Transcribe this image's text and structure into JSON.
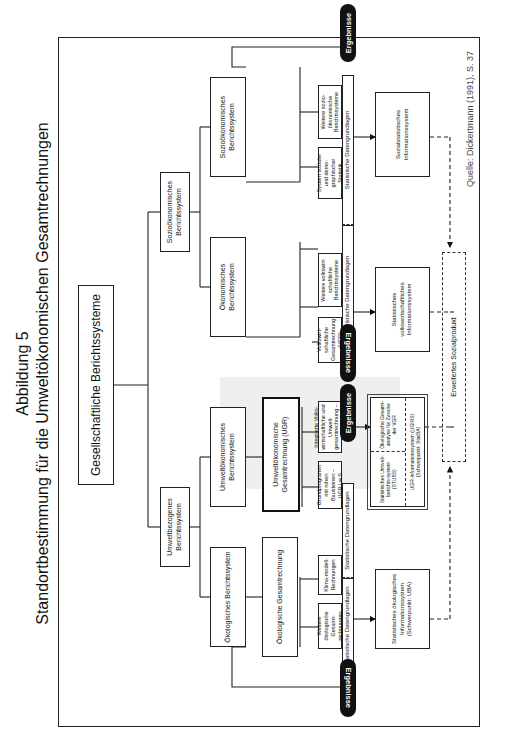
{
  "title": {
    "line1": "Abbildung 5",
    "line2": "Standortbestimmung für die Umweltökonomischen Gesamtrechnungen"
  },
  "source": "Quelle: Dickertmann (1991), S. 37",
  "level1": {
    "label": "Gesellschaftliche Berichtssysteme"
  },
  "level2": [
    {
      "label": "Umweltbezogenes Berichtssystem"
    },
    {
      "label": "Sozioökonomisches Berichtssystem"
    }
  ],
  "level3": [
    {
      "label": "Ökologisches Berichtssystem"
    },
    {
      "label": "Umweltökonomisches Berichtssystem"
    },
    {
      "label": "Ökonomisches Berichtssystem"
    },
    {
      "label": "Sozioökonomisches Berichtssystem"
    }
  ],
  "level4": [
    {
      "label": "Ökologische Gesamtrechnung"
    },
    {
      "label": "Umweltökonomische Gesamtrechnung (UGR)"
    }
  ],
  "sub_boxes": [
    {
      "label": "Weitere ökologische Gesamt-rechnungen"
    },
    {
      "label": "Klima-modell-Rechnungen"
    },
    {
      "label": "Grundprogramm mit rohen Bausteinen – UGR i.w.S."
    },
    {
      "label": "Integrierte Volks-wirtschaftliche und Umwelt-gesamtrechnung – UGR i.e.S."
    },
    {
      "label": "Volkswirt-schaftliche Gesamtrechnung (VGR)"
    },
    {
      "label": "Weitere volkswirt-schaftliche Berichtssysteme"
    },
    {
      "label": "System sozialer und demo-graphischer Statistik"
    },
    {
      "label": "Weitere sozio-ökonomische Berichtssysteme"
    }
  ],
  "data_basis": [
    {
      "label": "Statistische Datengrundlagen"
    },
    {
      "label": "Statistische Datengrundlagen"
    },
    {
      "label": "Statistische Datengrundlagen"
    },
    {
      "label": "Statistische Datengrundlagen"
    }
  ],
  "results": [
    {
      "label": "Ergebnisse"
    },
    {
      "label": "Ergebnisse"
    },
    {
      "label": "Ergebnisse"
    },
    {
      "label": "Ergebnisse"
    }
  ],
  "info_systems": [
    {
      "label": "Statistisches ökologisches Informationssystem (Schwerpunkt: UBA)"
    },
    {
      "top_left": "Statistisches Umwelt-berichts-system (STUBS)",
      "top_right": "Ökologische Gesamt-analyse für Zwecke der VGR",
      "bottom": "UGR-Informationssystem (UGRIS) (Schwerpunkt: StatBA)"
    },
    {
      "label": "Statistisches volkswirtschaftliches Informationssystem"
    },
    {
      "label": "Sozialstatistisches Informationssystem"
    }
  ],
  "extended": {
    "label": "Erweitertes Sozialprodukt"
  }
}
